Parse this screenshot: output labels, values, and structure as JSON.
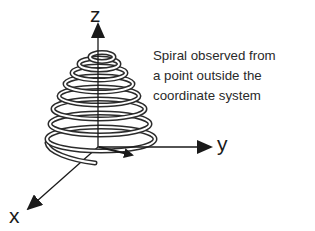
{
  "figure": {
    "type": "3d-conical-spiral",
    "caption_lines": [
      "Spiral observed from",
      "a point outside the",
      "coordinate system"
    ],
    "axes": {
      "z": {
        "label": "z"
      },
      "y": {
        "label": "y"
      },
      "x": {
        "label": "x"
      }
    },
    "spiral": {
      "turns": 8,
      "shape": "cone narrowing upward",
      "stroke_color": "#2b2b2b",
      "fill_color": "#ffffff"
    },
    "colors": {
      "axis": "#1a1a1a",
      "text": "#2a2a2a",
      "background": "#ffffff"
    }
  }
}
